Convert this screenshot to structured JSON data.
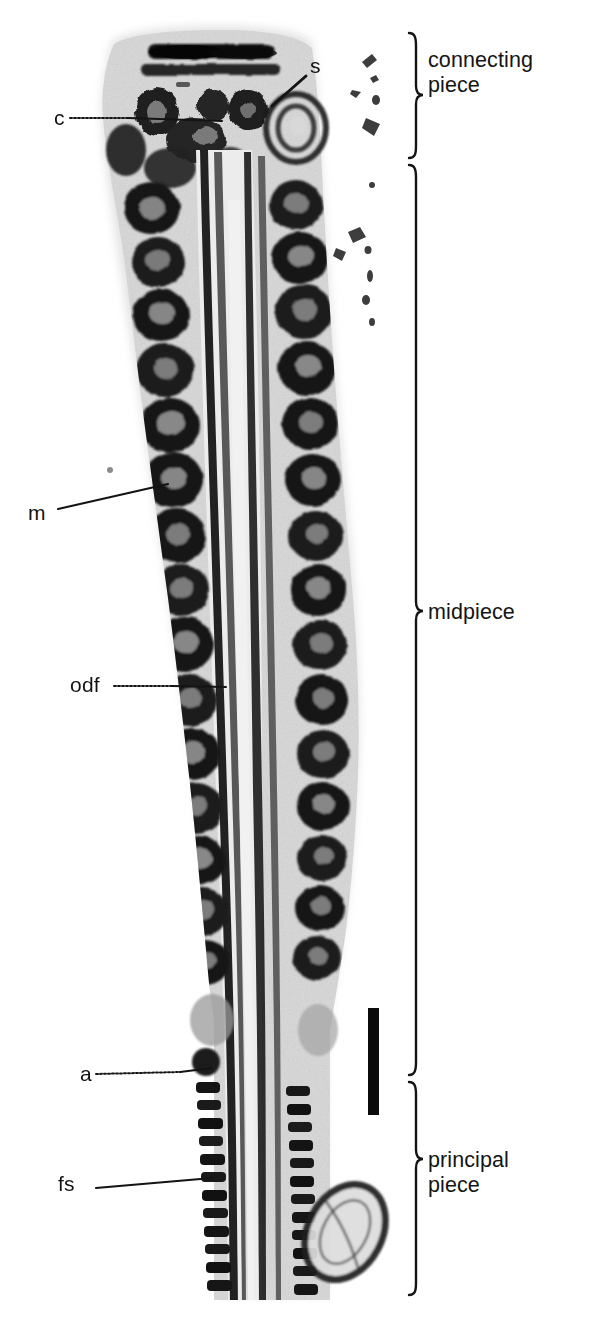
{
  "figure": {
    "type": "transmission-electron-micrograph",
    "background_color": "#ffffff",
    "ink_color": "#141414",
    "width_px": 590,
    "height_px": 1342
  },
  "structure_labels": [
    {
      "key": "s",
      "text": "s",
      "x": 310,
      "y": 66,
      "leader": "short-diagonal-down-left"
    },
    {
      "key": "c",
      "text": "c",
      "x": 54,
      "y": 118,
      "leader": "horizontal-dotted-right"
    },
    {
      "key": "m",
      "text": "m",
      "x": 28,
      "y": 513,
      "leader": "diagonal-up-right"
    },
    {
      "key": "odf",
      "text": "odf",
      "x": 70,
      "y": 686,
      "leader": "horizontal-right"
    },
    {
      "key": "a",
      "text": "a",
      "x": 80,
      "y": 1075,
      "leader": "horizontal-dotted-right"
    },
    {
      "key": "fs",
      "text": "fs",
      "x": 58,
      "y": 1185,
      "leader": "slight-diagonal-up-right"
    }
  ],
  "region_brackets": [
    {
      "key": "connecting-piece",
      "label": "connecting\npiece",
      "top": 33,
      "bottom": 158,
      "label_x": 428,
      "label_y": 60
    },
    {
      "key": "midpiece",
      "label": "midpiece",
      "top": 165,
      "bottom": 1075,
      "label_x": 428,
      "label_y": 610
    },
    {
      "key": "principal-piece",
      "label": "principal\npiece",
      "top": 1082,
      "bottom": 1295,
      "label_x": 428,
      "label_y": 1160
    }
  ],
  "scale_bar": {
    "present": true,
    "orientation": "vertical",
    "x": 368,
    "top": 1008,
    "bottom": 1115,
    "thickness_px": 11,
    "color": "#0b0b0b",
    "caption": ""
  },
  "legend_meanings": {
    "s": "satellite / striated column",
    "c": "connecting piece",
    "m": "mitochondrion",
    "odf": "outer dense fibre",
    "a": "annulus",
    "fs": "fibrous sheath"
  }
}
